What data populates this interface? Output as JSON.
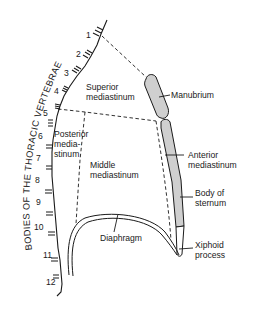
{
  "diagram": {
    "type": "anatomical line drawing",
    "colors": {
      "line": "#1a1a1a",
      "bone_fill": "#cfcfcf",
      "background": "#ffffff"
    },
    "spine_label": "BODIES OF THE THORACIC VERTEBRAE",
    "vertebrae": [
      "1",
      "2",
      "3",
      "4",
      "5",
      "6",
      "7",
      "8",
      "9",
      "10",
      "11",
      "12"
    ],
    "regions": {
      "superior": [
        "Superior",
        "mediastinum"
      ],
      "posterior": [
        "Posterior",
        "media-",
        "stinum"
      ],
      "middle": [
        "Middle",
        "mediastinum"
      ],
      "anterior": [
        "Anterior",
        "mediastinum"
      ]
    },
    "structures": {
      "manubrium": "Manubrium",
      "body_of_sternum": [
        "Body of",
        "sternum"
      ],
      "xiphoid": [
        "Xiphoid",
        "process"
      ],
      "diaphragm": "Diaphragm"
    }
  }
}
